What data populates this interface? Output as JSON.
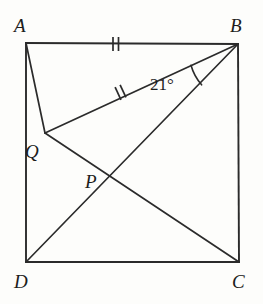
{
  "figure": {
    "kind": "geometry-diagram",
    "background_color": "#fdfdfb",
    "stroke_color": "#2b2b2b",
    "text_color": "#1c1c1c",
    "vertex_labels": {
      "A": "A",
      "B": "B",
      "C": "C",
      "D": "D",
      "P": "P",
      "Q": "Q"
    },
    "angle_label": "21°",
    "angle_value": 21,
    "angle_unit": "degrees",
    "angle_at_vertex": "B",
    "tick_marks": {
      "count_per_segment": 2,
      "segments": [
        "AB",
        "QB"
      ],
      "meaning": "AB = QB"
    },
    "points": {
      "A": {
        "x": 26,
        "y": 43
      },
      "B": {
        "x": 238,
        "y": 44
      },
      "C": {
        "x": 239,
        "y": 262
      },
      "D": {
        "x": 26,
        "y": 262
      },
      "Q": {
        "x": 45,
        "y": 133
      },
      "P": {
        "x": 105,
        "y": 178
      }
    },
    "segments": [
      {
        "name": "AB",
        "from": "A",
        "to": "B"
      },
      {
        "name": "BC",
        "from": "B",
        "to": "C"
      },
      {
        "name": "CD",
        "from": "C",
        "to": "D"
      },
      {
        "name": "DA",
        "from": "D",
        "to": "A"
      },
      {
        "name": "AQ",
        "from": "A",
        "to": "Q"
      },
      {
        "name": "QB",
        "from": "Q",
        "to": "B"
      },
      {
        "name": "QC",
        "from": "Q",
        "to": "C"
      },
      {
        "name": "DB",
        "from": "D",
        "to": "B"
      }
    ]
  }
}
